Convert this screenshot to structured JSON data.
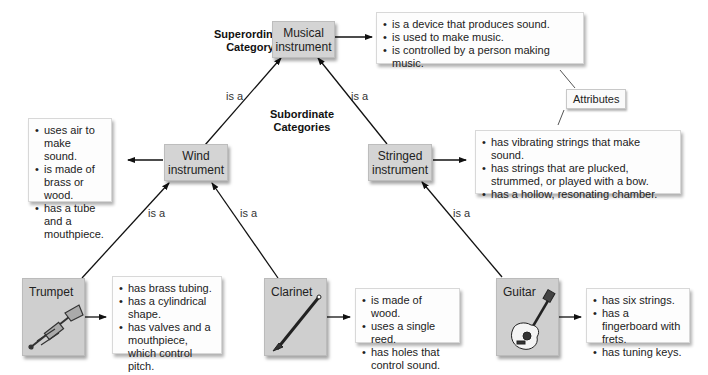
{
  "labels": {
    "superordinate": "Superordinate Category",
    "subordinate": "Subordinate Categories",
    "is_a": "is a",
    "attributes_tag": "Attributes"
  },
  "nodes": {
    "musical": {
      "line1": "Musical",
      "line2": "instrument"
    },
    "wind": {
      "line1": "Wind",
      "line2": "instrument"
    },
    "stringed": {
      "line1": "Stringed",
      "line2": "instrument"
    },
    "trumpet": {
      "name": "Trumpet",
      "icon": "trumpet-icon"
    },
    "clarinet": {
      "name": "Clarinet",
      "icon": "clarinet-icon"
    },
    "guitar": {
      "name": "Guitar",
      "icon": "guitar-icon"
    }
  },
  "attributes": {
    "musical": [
      "is a device that produces sound.",
      "is used to make music.",
      "is controlled by a person making music."
    ],
    "wind": [
      "uses air to make sound.",
      "is made of brass or wood.",
      "has a tube and a mouthpiece."
    ],
    "stringed": [
      "has vibrating strings that make sound.",
      "has strings that are plucked, strummed, or played with a bow.",
      "has a hollow, resonating chamber."
    ],
    "trumpet": [
      "has brass tubing.",
      "has a cylindrical shape.",
      "has valves and a mouthpiece, which control pitch."
    ],
    "clarinet": [
      "is made of wood.",
      "uses a single reed.",
      "has holes that control sound."
    ],
    "guitar": [
      "has six strings.",
      "has a fingerboard with frets.",
      "has tuning keys."
    ]
  },
  "colors": {
    "node_fill": "#d4d4d4",
    "attr_fill": "#fdfdfd",
    "line": "#111111"
  }
}
